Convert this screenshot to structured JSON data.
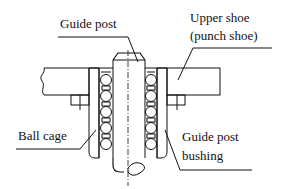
{
  "diagram": {
    "labels": {
      "guide_post": "Guide post",
      "upper_shoe_line1": "Upper shoe",
      "upper_shoe_line2": "(punch shoe)",
      "ball_cage": "Ball cage",
      "guide_post_bushing_line1": "Guide post",
      "guide_post_bushing_line2": "bushing"
    },
    "colors": {
      "line": "#111111",
      "background": "#ffffff"
    }
  }
}
